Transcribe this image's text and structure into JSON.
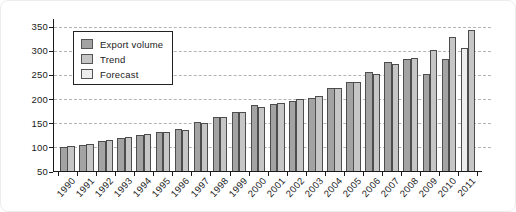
{
  "figure": {
    "background": "#ffffff",
    "text_color": "#1a1a1a",
    "gridline_color": "#b3b3b3",
    "bar_border_color": "#4d4d4d"
  },
  "legend": {
    "items": [
      {
        "label": "Export volume",
        "color": "#a3a3a3"
      },
      {
        "label": "Trend",
        "color": "#c6c6c6"
      },
      {
        "label": "Forecast",
        "color": "#ededed"
      }
    ]
  },
  "chart_data": {
    "type": "bar",
    "title": "",
    "xlabel": "",
    "ylabel": "",
    "ylim": [
      50,
      350
    ],
    "y_ticks": [
      50,
      100,
      150,
      200,
      250,
      300,
      350
    ],
    "grid": "horizontal-dashed",
    "legend_position": "upper-left",
    "categories": [
      1990,
      1991,
      1992,
      1993,
      1994,
      1995,
      1996,
      1997,
      1998,
      1999,
      2000,
      2001,
      2002,
      2003,
      2004,
      2005,
      2006,
      2007,
      2008,
      2009,
      2010,
      2011
    ],
    "series": [
      {
        "name": "Export volume",
        "color": "#a3a3a3",
        "values": [
          100,
          105,
          113,
          120,
          126,
          131,
          138,
          152,
          163,
          174,
          188,
          190,
          196,
          202,
          223,
          236,
          257,
          277,
          284,
          251,
          284,
          null
        ]
      },
      {
        "name": "Trend",
        "color": "#c6c6c6",
        "values": [
          102,
          108,
          115,
          122,
          127,
          132,
          137,
          150,
          163,
          173,
          183,
          191,
          200,
          206,
          223,
          236,
          252,
          272,
          285,
          301,
          329,
          344
        ]
      },
      {
        "name": "Forecast",
        "color": "#ededed",
        "values": [
          null,
          null,
          null,
          null,
          null,
          null,
          null,
          null,
          null,
          null,
          null,
          null,
          null,
          null,
          null,
          null,
          null,
          null,
          null,
          null,
          null,
          305
        ]
      }
    ]
  }
}
